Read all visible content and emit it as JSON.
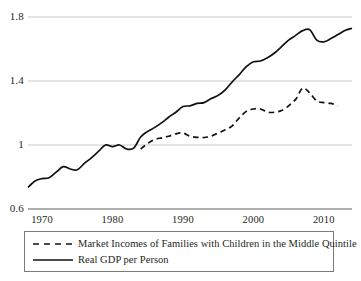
{
  "chart_data": {
    "type": "line",
    "title": "",
    "subtitle": "",
    "xlabel": "",
    "ylabel": "",
    "xlim": [
      1968,
      2014
    ],
    "ylim": [
      0.6,
      1.8
    ],
    "grid": true,
    "gridlines": [
      0.6,
      1.0,
      1.4,
      1.8
    ],
    "ytick_labels": [
      "1.8",
      "1.4",
      "1",
      "0.6"
    ],
    "ytick_values": [
      1.8,
      1.4,
      1.0,
      0.6
    ],
    "xtick_labels": [
      "1970",
      "1980",
      "1990",
      "2000",
      "2010"
    ],
    "xtick_values": [
      1970,
      1980,
      1990,
      2000,
      2010
    ],
    "legend_position": "below",
    "series": [
      {
        "name": "Market Incomes of Families with Children in the Middle Quintile",
        "style": "dashed",
        "color": "#111111",
        "x": [
          1984,
          1985,
          1986,
          1987,
          1988,
          1989,
          1990,
          1991,
          1992,
          1993,
          1994,
          1995,
          1996,
          1997,
          1998,
          1999,
          2000,
          2001,
          2002,
          2003,
          2004,
          2005,
          2006,
          2007,
          2008,
          2009,
          2010,
          2011,
          2012
        ],
        "values": [
          0.975,
          1.01,
          1.035,
          1.045,
          1.055,
          1.07,
          1.075,
          1.055,
          1.048,
          1.047,
          1.055,
          1.075,
          1.095,
          1.12,
          1.17,
          1.21,
          1.225,
          1.225,
          1.205,
          1.205,
          1.215,
          1.245,
          1.285,
          1.355,
          1.325,
          1.275,
          1.265,
          1.26,
          1.245
        ]
      },
      {
        "name": "Real GDP per Person",
        "style": "solid",
        "color": "#111111",
        "x": [
          1968,
          1969,
          1970,
          1971,
          1972,
          1973,
          1974,
          1975,
          1976,
          1977,
          1978,
          1979,
          1980,
          1981,
          1982,
          1983,
          1984,
          1985,
          1986,
          1987,
          1988,
          1989,
          1990,
          1991,
          1992,
          1993,
          1994,
          1995,
          1996,
          1997,
          1998,
          1999,
          2000,
          2001,
          2002,
          2003,
          2004,
          2005,
          2006,
          2007,
          2008,
          2009,
          2010,
          2011,
          2012,
          2013,
          2014
        ],
        "values": [
          0.735,
          0.775,
          0.79,
          0.795,
          0.83,
          0.865,
          0.85,
          0.845,
          0.885,
          0.92,
          0.96,
          1.0,
          0.99,
          1.0,
          0.975,
          0.98,
          1.05,
          1.085,
          1.11,
          1.14,
          1.175,
          1.205,
          1.24,
          1.245,
          1.26,
          1.265,
          1.29,
          1.31,
          1.345,
          1.395,
          1.44,
          1.49,
          1.52,
          1.525,
          1.545,
          1.575,
          1.615,
          1.655,
          1.685,
          1.715,
          1.72,
          1.655,
          1.645,
          1.665,
          1.69,
          1.715,
          1.73
        ]
      }
    ]
  },
  "axes": {
    "left_px": 28,
    "right_px": 352,
    "top_px": 17,
    "bottom_px": 209
  },
  "legend": {
    "entries": [
      {
        "label": "Market Incomes of Families with Children in the Middle Quintile",
        "swatch": "dashed-line-swatch"
      },
      {
        "label": "Real GDP per Person",
        "swatch": "solid-line-swatch"
      }
    ]
  }
}
